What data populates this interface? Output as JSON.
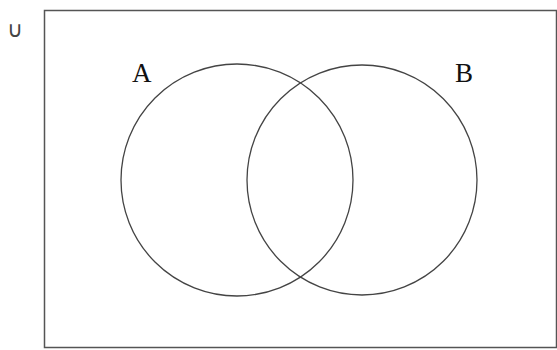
{
  "diagram": {
    "type": "venn",
    "universe": {
      "label": "∪",
      "rect": {
        "x": 44.5,
        "y": 10.5,
        "width": 512,
        "height": 337
      },
      "stroke": "#555555"
    },
    "sets": [
      {
        "name": "A",
        "label": "A",
        "cx": 237,
        "cy": 180,
        "r": 116,
        "label_x": 132,
        "label_y": 82
      },
      {
        "name": "B",
        "label": "B",
        "cx": 362,
        "cy": 180,
        "r": 115,
        "label_x": 455,
        "label_y": 82
      }
    ],
    "stroke_color": "#444444"
  }
}
